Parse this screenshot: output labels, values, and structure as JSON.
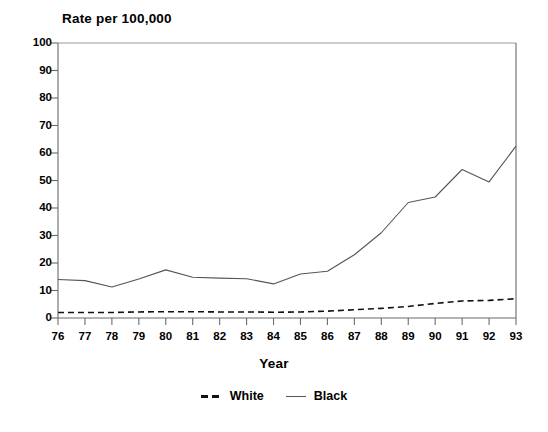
{
  "chart_data": {
    "type": "line",
    "title": "Rate per 100,000",
    "xlabel": "Year",
    "ylabel": "",
    "x": [
      "76",
      "77",
      "78",
      "79",
      "80",
      "81",
      "82",
      "83",
      "84",
      "85",
      "86",
      "87",
      "88",
      "89",
      "90",
      "91",
      "92",
      "93"
    ],
    "xlim": [
      76,
      93
    ],
    "ylim": [
      0,
      100
    ],
    "yticks": [
      "0",
      "10",
      "20",
      "30",
      "40",
      "50",
      "60",
      "70",
      "80",
      "90",
      "100"
    ],
    "grid": false,
    "legend_position": "bottom-center",
    "series": [
      {
        "name": "White",
        "style": "dashed",
        "color": "#111111",
        "values": [
          2.0,
          2.0,
          2.0,
          2.2,
          2.3,
          2.3,
          2.2,
          2.2,
          2.1,
          2.2,
          2.5,
          3.0,
          3.5,
          4.2,
          5.3,
          6.2,
          6.4,
          7.0
        ]
      },
      {
        "name": "Black",
        "style": "solid",
        "color": "#555555",
        "values": [
          14.0,
          13.6,
          11.3,
          14.2,
          17.5,
          14.8,
          14.5,
          14.3,
          12.4,
          16.0,
          17.0,
          23.0,
          31.0,
          42.0,
          44.0,
          54.0,
          49.5,
          62.5
        ]
      }
    ]
  },
  "legend": {
    "items": [
      {
        "label": "White",
        "marker": "dashed-line-icon"
      },
      {
        "label": "Black",
        "marker": "solid-line-icon"
      }
    ]
  },
  "axes": {
    "y_tick_labels": [
      "100",
      "90",
      "80",
      "70",
      "60",
      "50",
      "40",
      "30",
      "20",
      "10",
      "0"
    ],
    "x_tick_labels": [
      "76",
      "77",
      "78",
      "79",
      "80",
      "81",
      "82",
      "83",
      "84",
      "85",
      "86",
      "87",
      "88",
      "89",
      "90",
      "91",
      "92",
      "93"
    ]
  }
}
